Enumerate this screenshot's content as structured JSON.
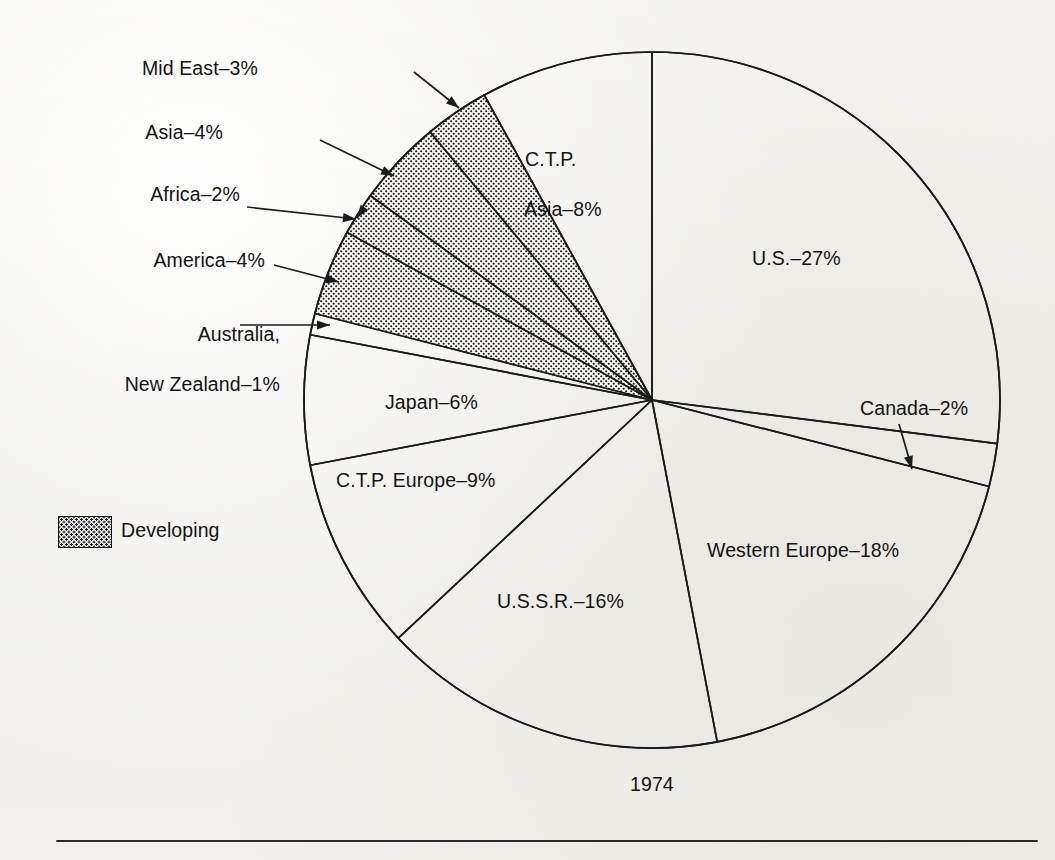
{
  "figure": {
    "year_caption": "1974",
    "legend": {
      "label": "Developing",
      "swatch": "stipple-pattern"
    },
    "background_color": "#f2f1ed",
    "ink_color": "#131313"
  },
  "chart_data": {
    "type": "pie",
    "title": "1974",
    "xlabel": "",
    "ylabel": "",
    "units": "percent",
    "total": 100,
    "start_angle_deg": 0,
    "direction": "clockwise",
    "legend": [
      {
        "name": "Developing",
        "swatch": "stipple"
      }
    ],
    "groups": [
      {
        "name": "Developing",
        "pattern": "stipple",
        "members": [
          "America",
          "Africa",
          "Asia",
          "Mid East"
        ],
        "total": 13
      }
    ],
    "categories": [
      "U.S.",
      "Canada",
      "Western Europe",
      "U.S.S.R.",
      "C.T.P. Europe",
      "Japan",
      "Australia, New Zealand",
      "America",
      "Africa",
      "Asia",
      "Mid East",
      "C.T.P. Asia"
    ],
    "values": [
      27,
      2,
      18,
      16,
      9,
      6,
      1,
      4,
      2,
      4,
      3,
      8
    ],
    "slices": [
      {
        "label": "U.S.",
        "value": 27,
        "percent": "27%",
        "developing": false,
        "label_text": "U.S.–27%"
      },
      {
        "label": "Canada",
        "value": 2,
        "percent": "2%",
        "developing": false,
        "label_text": "Canada–2%"
      },
      {
        "label": "Western Europe",
        "value": 18,
        "percent": "18%",
        "developing": false,
        "label_text": "Western Europe–18%"
      },
      {
        "label": "U.S.S.R.",
        "value": 16,
        "percent": "16%",
        "developing": false,
        "label_text": "U.S.S.R.–16%"
      },
      {
        "label": "C.T.P. Europe",
        "value": 9,
        "percent": "9%",
        "developing": false,
        "label_text": "C.T.P. Europe–9%"
      },
      {
        "label": "Japan",
        "value": 6,
        "percent": "6%",
        "developing": false,
        "label_text": "Japan–6%"
      },
      {
        "label": "Australia, New Zealand",
        "value": 1,
        "percent": "1%",
        "developing": false,
        "label_line1": "Australia,",
        "label_line2": "New Zealand–1%"
      },
      {
        "label": "America",
        "value": 4,
        "percent": "4%",
        "developing": true,
        "label_text": "America–4%"
      },
      {
        "label": "Africa",
        "value": 2,
        "percent": "2%",
        "developing": true,
        "label_text": "Africa–2%"
      },
      {
        "label": "Asia",
        "value": 4,
        "percent": "4%",
        "developing": true,
        "label_text": "Asia–4%"
      },
      {
        "label": "Mid East",
        "value": 3,
        "percent": "3%",
        "developing": true,
        "label_text": "Mid East–3%"
      },
      {
        "label": "C.T.P. Asia",
        "value": 8,
        "percent": "8%",
        "developing": false,
        "label_line1": "C.T.P.",
        "label_line2": "Asia–8%"
      }
    ]
  }
}
